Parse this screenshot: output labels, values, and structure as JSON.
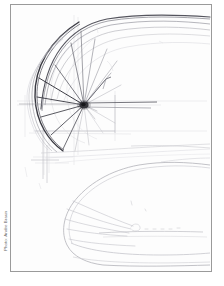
{
  "image": {
    "kind": "scanned-pencil-sketch",
    "subject": "automotive design sketch",
    "paper_color": "#fdfdfd",
    "frame_color": "#9a9a9a",
    "background_color": "#ffffff",
    "width": 224,
    "height": 286
  },
  "credit": {
    "text": "Photo: Andre Braun",
    "orientation": "rotated-90-ccw",
    "color": "#6d6d6d"
  },
  "sketch": {
    "title": "Car wheel and body study",
    "media": "graphite pencil on paper",
    "ink_colors": {
      "darkest": "#2b2b31",
      "dark": "#4a4a52",
      "mid": "#7b7b84",
      "light": "#a9a9b0",
      "faint": "#cfcfd4",
      "ghost": "#e2e2e6"
    },
    "elements": [
      {
        "name": "wheel-hub",
        "desc": "dark convergence point of all spokes",
        "cx": 73,
        "cy": 100,
        "r": 4
      },
      {
        "name": "wheel-rim-arc",
        "desc": "heavy dark arc forming left side of wheel"
      },
      {
        "name": "spoke-fan",
        "desc": "radiating spokes from hub toward rim",
        "count": 14
      },
      {
        "name": "fender-sweep-lines",
        "desc": "multiple near-parallel curves sweeping from upper left to right edge",
        "count": 5
      },
      {
        "name": "axle-lines",
        "desc": "two horizontal lines extending right from hub",
        "count": 2
      },
      {
        "name": "construction-grid",
        "desc": "faint vertical and horizontal layout guides"
      },
      {
        "name": "car-body-outline",
        "desc": "large rounded nose/hood form in lower half"
      },
      {
        "name": "nose-fan-lines",
        "desc": "short fan of lines inside rounded front end",
        "count": 4
      },
      {
        "name": "horizon-lines",
        "desc": "faint long horizontal sweeps across middle of sheet",
        "count": 3
      }
    ]
  }
}
